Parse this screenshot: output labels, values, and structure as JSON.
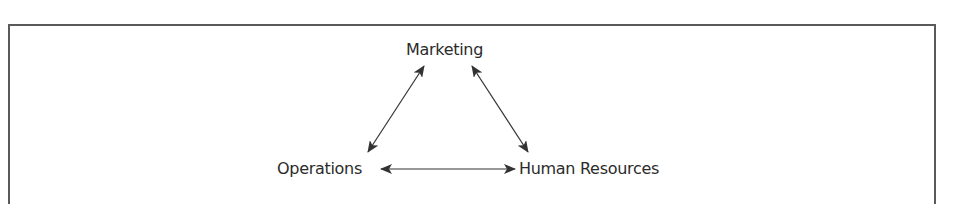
{
  "diagram": {
    "title": "",
    "nodes": [
      {
        "id": "marketing",
        "label": "Marketing"
      },
      {
        "id": "operations",
        "label": "Operations"
      },
      {
        "id": "human_resources",
        "label": "Human Resources"
      }
    ],
    "edges": [
      {
        "from": "marketing",
        "to": "operations",
        "type": "bidirectional-arrow"
      },
      {
        "from": "marketing",
        "to": "human_resources",
        "type": "bidirectional-arrow"
      },
      {
        "from": "operations",
        "to": "human_resources",
        "type": "bidirectional-arrow"
      }
    ],
    "colors": {
      "text": "#2b2b2b",
      "arrow": "#333333",
      "frame": "#5a5a5a",
      "background": "#ffffff"
    }
  }
}
